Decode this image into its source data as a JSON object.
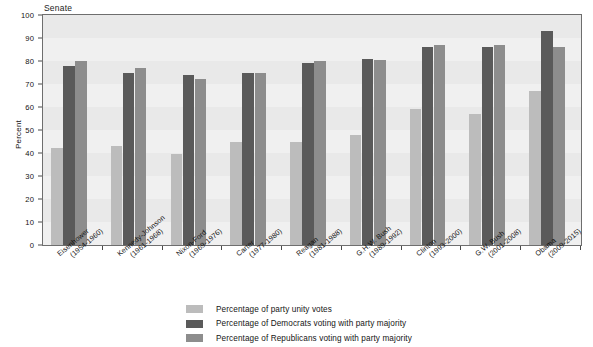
{
  "chart_data": {
    "type": "bar",
    "title": "Senate",
    "xlabel": "",
    "ylabel": "Percent",
    "ylim": [
      0,
      100
    ],
    "ytick_step": 10,
    "yticks": [
      0,
      10,
      20,
      30,
      40,
      50,
      60,
      70,
      80,
      90,
      100
    ],
    "grid": false,
    "legend_position": "bottom",
    "categories": [
      "Eisenhower",
      "Kennedy-Johnson",
      "Nixon-Ford",
      "Carter",
      "Reagan",
      "G.H.W. Bush",
      "Clinton",
      "G.W. Bush",
      "Obama"
    ],
    "category_years": [
      "(1954-1960)",
      "(1961-1968)",
      "(1969-1976)",
      "(1977-1980)",
      "(1981-1988)",
      "(1989-1992)",
      "(1993-2000)",
      "(2001-2008)",
      "(2009-2015)"
    ],
    "series": [
      {
        "name": "Percentage of party unity votes",
        "color": "#bcbcbc",
        "values": [
          42,
          43,
          39.5,
          45,
          45,
          48,
          59,
          57,
          67
        ]
      },
      {
        "name": "Percentage of Democrats voting with party majority",
        "color": "#5a5a5a",
        "values": [
          78,
          75,
          74,
          75,
          79,
          81,
          86,
          86,
          93
        ]
      },
      {
        "name": "Percentage of Republicans voting with party majority",
        "color": "#8d8d8d",
        "values": [
          80,
          77,
          72,
          75,
          80,
          80.5,
          87,
          87,
          86
        ]
      }
    ]
  },
  "legend": {
    "items": [
      "Percentage of party unity votes",
      "Percentage of Democrats voting with party majority",
      "Percentage of Republicans voting with party majority"
    ]
  }
}
